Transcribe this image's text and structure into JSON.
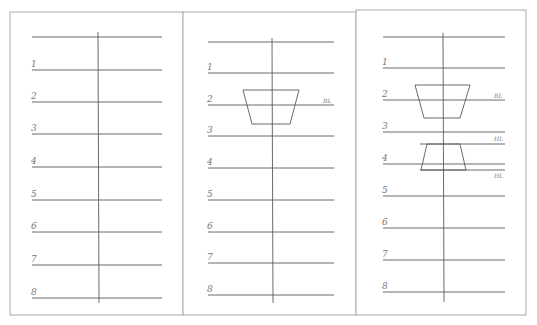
{
  "colors": {
    "background": "#ffffff",
    "panel_border": "#a9a9a9",
    "line": "#5a5a5a",
    "label": "#808080"
  },
  "panels": [
    {
      "id": "panel-1",
      "box": {
        "x": 10,
        "y": 12,
        "w": 173,
        "h": 303
      },
      "axis": {
        "x": 98,
        "y1": 32,
        "y2": 303
      },
      "line_x1": 32,
      "line_x2": 162,
      "top_line": {
        "y": 37
      },
      "rows": [
        {
          "label": "1",
          "y": 70
        },
        {
          "label": "2",
          "y": 102
        },
        {
          "label": "3",
          "y": 134
        },
        {
          "label": "4",
          "y": 167
        },
        {
          "label": "5",
          "y": 200
        },
        {
          "label": "6",
          "y": 232
        },
        {
          "label": "7",
          "y": 265
        },
        {
          "label": "8",
          "y": 298
        }
      ],
      "extra_lines": [],
      "trapezoids": [],
      "tags": []
    },
    {
      "id": "panel-2",
      "box": {
        "x": 183,
        "y": 12,
        "w": 173,
        "h": 303
      },
      "axis": {
        "x": 272,
        "y1": 38,
        "y2": 303
      },
      "line_x1": 208,
      "line_x2": 334,
      "top_line": {
        "y": 42
      },
      "rows": [
        {
          "label": "1",
          "y": 73
        },
        {
          "label": "2",
          "y": 105
        },
        {
          "label": "3",
          "y": 136
        },
        {
          "label": "4",
          "y": 168
        },
        {
          "label": "5",
          "y": 200
        },
        {
          "label": "6",
          "y": 232
        },
        {
          "label": "7",
          "y": 263
        },
        {
          "label": "8",
          "y": 295
        }
      ],
      "extra_lines": [],
      "trapezoids": [
        {
          "top_y": 90,
          "top_x1": 243,
          "top_x2": 299,
          "bot_y": 124,
          "bot_x1": 252,
          "bot_x2": 290
        }
      ],
      "tags": [
        {
          "text": "BL",
          "x": 323,
          "y": 103
        }
      ]
    },
    {
      "id": "panel-3",
      "box": {
        "x": 356,
        "y": 10,
        "w": 170,
        "h": 305
      },
      "axis": {
        "x": 443,
        "y1": 33,
        "y2": 302
      },
      "line_x1": 383,
      "line_x2": 505,
      "top_line": {
        "y": 37
      },
      "rows": [
        {
          "label": "1",
          "y": 68
        },
        {
          "label": "2",
          "y": 100
        },
        {
          "label": "3",
          "y": 132
        },
        {
          "label": "4",
          "y": 164
        },
        {
          "label": "5",
          "y": 196
        },
        {
          "label": "6",
          "y": 228
        },
        {
          "label": "7",
          "y": 260
        },
        {
          "label": "8",
          "y": 292
        }
      ],
      "extra_lines": [
        {
          "x1": 420,
          "x2": 505,
          "y": 144
        },
        {
          "x1": 420,
          "x2": 505,
          "y": 170
        }
      ],
      "trapezoids": [
        {
          "top_y": 85,
          "top_x1": 415,
          "top_x2": 470,
          "bot_y": 118,
          "bot_x1": 424,
          "bot_x2": 460
        },
        {
          "top_y": 144,
          "top_x1": 427,
          "top_x2": 460,
          "bot_y": 170,
          "bot_x1": 421,
          "bot_x2": 466
        }
      ],
      "tags": [
        {
          "text": "BL",
          "x": 494,
          "y": 98
        },
        {
          "text": "HL",
          "x": 494,
          "y": 141
        },
        {
          "text": "HL",
          "x": 494,
          "y": 178
        }
      ]
    }
  ]
}
